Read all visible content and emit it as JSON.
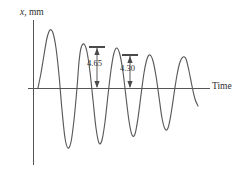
{
  "figure": {
    "kind": "damped-oscillation-diagram",
    "background_color": "#ffffff",
    "line_color": "#5a5a5a",
    "axis_color": "#555555",
    "text_color": "#2e2e2e"
  },
  "axes": {
    "y_axis_label_variable": "x",
    "y_axis_label_separator": ", ",
    "y_axis_label_unit": "mm",
    "x_axis_label": "Time",
    "origin_px": {
      "x": 33,
      "y": 88
    },
    "x_axis_extent_px": {
      "x1": 28,
      "x2": 210
    },
    "y_axis_extent_px": {
      "y1": 20,
      "y2": 165
    }
  },
  "annotations": [
    {
      "name": "amplitude-dimension-1",
      "label": "4.65",
      "x_px": 97,
      "top_y_px": 47,
      "bottom_y_px": 88
    },
    {
      "name": "amplitude-dimension-2",
      "label": "4.30",
      "x_px": 130,
      "top_y_px": 55,
      "bottom_y_px": 88
    }
  ],
  "chart_data": {
    "type": "line",
    "title": "",
    "xlabel": "Time",
    "ylabel": "x, mm",
    "grid": false,
    "legend": null,
    "annotated_peak_amplitudes": [
      4.65,
      4.3
    ],
    "annotated_peak_units": "mm",
    "curve_pixel_points": [
      [
        38,
        88
      ],
      [
        41,
        73
      ],
      [
        44,
        55
      ],
      [
        47,
        38
      ],
      [
        50,
        30
      ],
      [
        53,
        33
      ],
      [
        56,
        48
      ],
      [
        59,
        75
      ],
      [
        62,
        110
      ],
      [
        65,
        138
      ],
      [
        68,
        148
      ],
      [
        71,
        142
      ],
      [
        74,
        120
      ],
      [
        77,
        88
      ],
      [
        79,
        62
      ],
      [
        81,
        48
      ],
      [
        84,
        44
      ],
      [
        87,
        52
      ],
      [
        90,
        72
      ],
      [
        93,
        100
      ],
      [
        96,
        128
      ],
      [
        99,
        143
      ],
      [
        102,
        140
      ],
      [
        105,
        122
      ],
      [
        108,
        95
      ],
      [
        111,
        70
      ],
      [
        114,
        53
      ],
      [
        117,
        48
      ],
      [
        120,
        55
      ],
      [
        123,
        72
      ],
      [
        126,
        97
      ],
      [
        129,
        121
      ],
      [
        132,
        135
      ],
      [
        135,
        134
      ],
      [
        138,
        118
      ],
      [
        141,
        95
      ],
      [
        144,
        73
      ],
      [
        147,
        59
      ],
      [
        150,
        55
      ],
      [
        153,
        61
      ],
      [
        156,
        76
      ],
      [
        159,
        97
      ],
      [
        162,
        118
      ],
      [
        165,
        129
      ],
      [
        168,
        128
      ],
      [
        171,
        114
      ],
      [
        174,
        94
      ],
      [
        177,
        75
      ],
      [
        180,
        62
      ],
      [
        183,
        57
      ],
      [
        186,
        59
      ],
      [
        189,
        71
      ],
      [
        192,
        86
      ],
      [
        195,
        99
      ],
      [
        198,
        106
      ]
    ]
  }
}
